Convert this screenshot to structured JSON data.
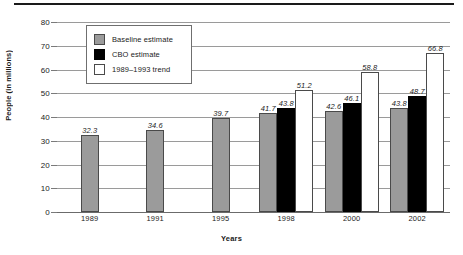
{
  "chart_data": {
    "type": "bar",
    "title": "",
    "xlabel": "Years",
    "ylabel": "People (in millions)",
    "ylim": [
      0,
      80
    ],
    "yticks": [
      0,
      10,
      20,
      30,
      40,
      50,
      60,
      70,
      80
    ],
    "ytick_labels": [
      "0",
      "10",
      "20",
      "30",
      "40",
      "50",
      "60",
      "70",
      "80"
    ],
    "grid": true,
    "legend_position": "upper-left-inside",
    "categories": [
      "1989",
      "1991",
      "1995",
      "1998",
      "2000",
      "2002"
    ],
    "series": [
      {
        "name": "Baseline estimate",
        "color": "#9b9b9b",
        "values": [
          32.3,
          34.6,
          39.7,
          41.7,
          42.6,
          43.8
        ],
        "labels": [
          "32.3",
          "34.6",
          "39.7",
          "41.7",
          "42.6",
          "43.8"
        ]
      },
      {
        "name": "CBO estimate",
        "color": "#000000",
        "values": [
          null,
          null,
          null,
          43.8,
          46.1,
          48.7
        ],
        "labels": [
          "",
          "",
          "",
          "43.8",
          "46.1",
          "48.7"
        ]
      },
      {
        "name": "1989–1993 trend",
        "color": "#ffffff",
        "values": [
          null,
          null,
          null,
          51.2,
          58.8,
          66.8
        ],
        "labels": [
          "",
          "",
          "",
          "51.2",
          "58.8",
          "66.8"
        ]
      }
    ]
  },
  "legend": {
    "items": [
      {
        "label": "Baseline estimate",
        "swatch": "baseline"
      },
      {
        "label": "CBO estimate",
        "swatch": "cbo"
      },
      {
        "label": "1989–1993 trend",
        "swatch": "trend"
      }
    ]
  }
}
